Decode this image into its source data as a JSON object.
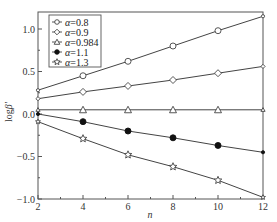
{
  "chart_data": {
    "type": "line",
    "title": "",
    "xlabel": "n",
    "ylabel": "log β'",
    "xlim": [
      2,
      12
    ],
    "ylim": [
      -1.0,
      1.2
    ],
    "xticks": [
      2,
      4,
      6,
      8,
      10,
      12
    ],
    "xtick_labels": [
      "2",
      "4",
      "6",
      "8",
      "10",
      "12"
    ],
    "yticks": [
      -1.0,
      -0.5,
      0.0,
      0.5,
      1.0
    ],
    "ytick_labels": [
      "−1.0",
      "−0.5",
      "0.0",
      "0.5",
      "1.0"
    ],
    "grid": false,
    "legend_position": "upper left",
    "x": [
      2,
      4,
      6,
      8,
      10,
      12
    ],
    "series": [
      {
        "name": "α=0.8",
        "label_prefix": "α",
        "label_value": "=0.8",
        "marker": "circle-open",
        "values": [
          0.28,
          0.45,
          0.62,
          0.8,
          0.98,
          1.15
        ]
      },
      {
        "name": "α=0.9",
        "label_prefix": "α",
        "label_value": "=0.9",
        "marker": "diamond-open",
        "values": [
          0.18,
          0.26,
          0.33,
          0.4,
          0.48,
          0.56
        ]
      },
      {
        "name": "α=0.984",
        "label_prefix": "α",
        "label_value": "=0.984",
        "marker": "triangle-open",
        "values": [
          0.05,
          0.05,
          0.05,
          0.05,
          0.05,
          0.05
        ]
      },
      {
        "name": "α=1.1",
        "label_prefix": "α",
        "label_value": "=1.1",
        "marker": "circle-filled",
        "values": [
          0.0,
          -0.09,
          -0.2,
          -0.28,
          -0.37,
          -0.45
        ]
      },
      {
        "name": "α=1.3",
        "label_prefix": "α",
        "label_value": "=1.3",
        "marker": "star-open",
        "values": [
          -0.09,
          -0.29,
          -0.48,
          -0.62,
          -0.78,
          -0.98
        ]
      }
    ]
  },
  "colors": {
    "line": "#444444",
    "axis": "#555555"
  }
}
